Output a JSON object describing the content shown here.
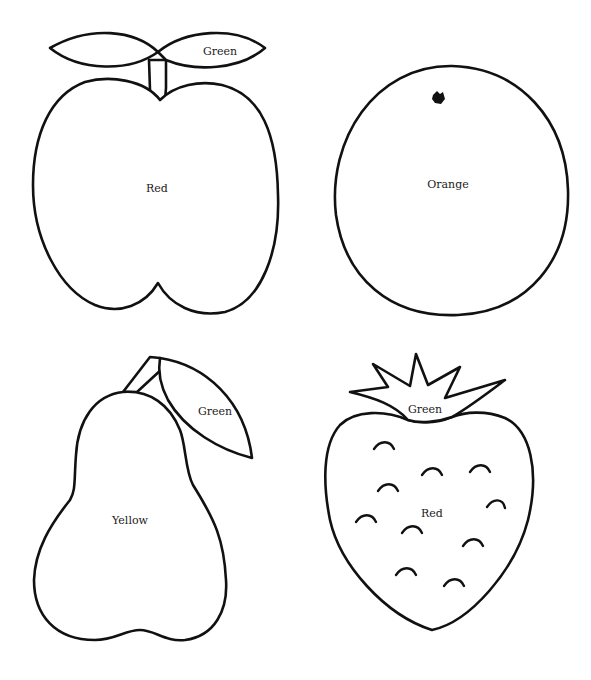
{
  "page": {
    "background": "#ffffff",
    "line_color": "#111111"
  },
  "fruits": {
    "apple": {
      "name": "apple",
      "body_label": "Red",
      "leaf_label": "Green"
    },
    "orange": {
      "name": "orange",
      "body_label": "Orange"
    },
    "pear": {
      "name": "pear",
      "body_label": "Yellow",
      "leaf_label": "Green"
    },
    "strawberry": {
      "name": "strawberry",
      "body_label": "Red",
      "crown_label": "Green",
      "seed_count": 11
    }
  }
}
